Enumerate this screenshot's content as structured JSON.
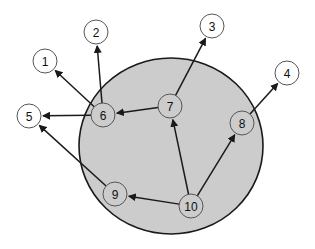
{
  "diagram": {
    "region": {
      "cx": 171,
      "cy": 146,
      "rx": 92,
      "ry": 88,
      "fill": "#cccccc",
      "stroke": "#1a1a1a"
    },
    "node_radius": 12,
    "nodes": [
      {
        "id": "1",
        "label": "1",
        "x": 45,
        "y": 61,
        "inside": false
      },
      {
        "id": "2",
        "label": "2",
        "x": 96,
        "y": 32,
        "inside": false
      },
      {
        "id": "3",
        "label": "3",
        "x": 212,
        "y": 26,
        "inside": false
      },
      {
        "id": "4",
        "label": "4",
        "x": 287,
        "y": 73,
        "inside": false
      },
      {
        "id": "5",
        "label": "5",
        "x": 29,
        "y": 116,
        "inside": false
      },
      {
        "id": "6",
        "label": "6",
        "x": 103,
        "y": 115,
        "inside": true
      },
      {
        "id": "7",
        "label": "7",
        "x": 170,
        "y": 106,
        "inside": true
      },
      {
        "id": "8",
        "label": "8",
        "x": 242,
        "y": 123,
        "inside": true
      },
      {
        "id": "9",
        "label": "9",
        "x": 115,
        "y": 194,
        "inside": true
      },
      {
        "id": "10",
        "label": "10",
        "x": 191,
        "y": 206,
        "inside": true
      }
    ],
    "edges": [
      {
        "from": "6",
        "to": "1"
      },
      {
        "from": "6",
        "to": "2"
      },
      {
        "from": "6",
        "to": "5"
      },
      {
        "from": "7",
        "to": "6"
      },
      {
        "from": "7",
        "to": "3"
      },
      {
        "from": "8",
        "to": "4"
      },
      {
        "from": "9",
        "to": "5"
      },
      {
        "from": "10",
        "to": "9"
      },
      {
        "from": "10",
        "to": "7"
      },
      {
        "from": "10",
        "to": "8"
      }
    ],
    "colors": {
      "inside_fill": "#cccccc",
      "outside_fill": "#ffffff",
      "node_stroke": "#555555",
      "edge": "#1a1a1a"
    }
  }
}
